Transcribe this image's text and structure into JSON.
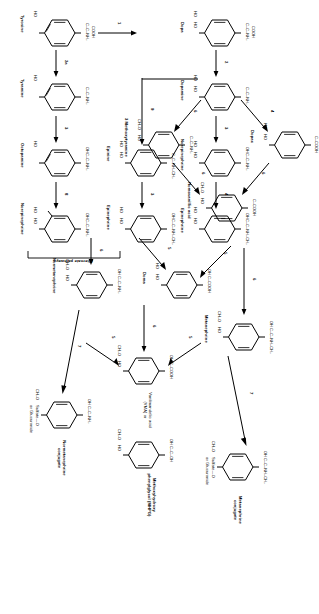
{
  "figure": {
    "orientation": "rotated-90-cw",
    "ink_color": "#000000",
    "background": "#ffffff"
  },
  "compounds": [
    {
      "id": "tyrosine",
      "name": "Tyrosine",
      "chain": "C–C–NH2 / COOH",
      "ring_substituents": [
        "HO"
      ]
    },
    {
      "id": "tyramine",
      "name": "Tyramine",
      "chain": "C–C–NH2",
      "ring_substituents": [
        "HO"
      ]
    },
    {
      "id": "octopamine",
      "name": "Octopamine",
      "chain": "OH C–C–NH2",
      "ring_substituents": [
        "HO"
      ]
    },
    {
      "id": "norepinephrine-alt",
      "name": "Norepinephrine",
      "chain": "OH C–C–NH2",
      "ring_substituents": [
        "HO",
        "HO"
      ]
    },
    {
      "id": "dopa",
      "name": "Dopa",
      "chain": "C–C–NH2 / COOH",
      "ring_substituents": [
        "HO",
        "HO"
      ]
    },
    {
      "id": "dopamine",
      "name": "Dopamine",
      "chain": "C–C–NH2",
      "ring_substituents": [
        "HO",
        "HO"
      ]
    },
    {
      "id": "norepinephrine",
      "name": "Norepinephrine",
      "chain": "OH C–C–NH2",
      "ring_substituents": [
        "HO",
        "HO"
      ]
    },
    {
      "id": "epinephrine",
      "name": "Epinephrine",
      "chain": "OH C–C–NH–CH3",
      "ring_substituents": [
        "HO",
        "HO"
      ]
    },
    {
      "id": "epinine",
      "name": "Epinine",
      "chain": "C–C–NH–CH3",
      "ring_substituents": [
        "HO",
        "HO"
      ]
    },
    {
      "id": "epinephrine-alt",
      "name": "Epinephrine",
      "chain": "OH C–C–NH–CH3",
      "ring_substituents": [
        "HO",
        "HO"
      ]
    },
    {
      "id": "methoxytyramine",
      "name": "3 Methoxytyramine",
      "chain": "C–C–NH2",
      "ring_substituents": [
        "CH3O",
        "HO"
      ]
    },
    {
      "id": "dopac",
      "name": "Dopac",
      "chain": "C–COOH",
      "ring_substituents": [
        "HO",
        "HO"
      ]
    },
    {
      "id": "homovanillic",
      "name": "Homovanillic acid",
      "chain": "C–COOH",
      "ring_substituents": [
        "CH3O",
        "HO"
      ]
    },
    {
      "id": "doma",
      "name": "Doma",
      "chain": "OH C–COOH",
      "ring_substituents": [
        "HO",
        "HO"
      ]
    },
    {
      "id": "normetanephrine",
      "name": "Normetanephrine",
      "chain": "OH C–C–NH2",
      "ring_substituents": [
        "CH3O",
        "HO"
      ]
    },
    {
      "id": "metanephrine",
      "name": "Metanephrine",
      "chain": "OH C–C–NH–CH3",
      "ring_substituents": [
        "CH3O",
        "HO"
      ]
    },
    {
      "id": "vma",
      "name": "Vanilmandelic acid (VMA) or",
      "chain": "OH C–COOH",
      "ring_substituents": [
        "CH3O",
        "HO"
      ]
    },
    {
      "id": "mhpg",
      "name": "Methoxyhydroxy phenylglycol (MHPG)",
      "chain": "OH C–C–OH",
      "ring_substituents": [
        "CH3O",
        "HO"
      ]
    },
    {
      "id": "nm-conjugate",
      "name": "Normetanephrine conjugate",
      "chain": "OH C–C–NH2",
      "ring_substituents": [
        "CH3O",
        "Sulfate—O or Glucuronide"
      ]
    },
    {
      "id": "m-conjugate",
      "name": "Metanephrine conjugate",
      "chain": "OH C–C–NH–CH3",
      "ring_substituents": [
        "CH3O",
        "Sulfate—O or Glucuronide"
      ]
    }
  ],
  "labels": {
    "tyrosine": "Tyrosine",
    "tyramine": "Tyramine",
    "octopamine": "Octopamine",
    "norepinephrine_alt": "Norepinephrine",
    "alternate_pathways": "Alternate pathways",
    "epinephrine_alt": "Epinephrine",
    "dopa": "Dopa",
    "dopamine": "Dopamine",
    "norepinephrine": "Norepinephrine",
    "epinephrine": "Epinephrine",
    "epinine": "Epinine",
    "methoxytyramine": "3 Methoxytyramine",
    "dopac": "Dopac",
    "homovanillic_acid": "Homovanillic acid",
    "doma": "Doma",
    "normetanephrine": "Normetanephrine",
    "metanephrine": "Metanephrine",
    "vma": "Vanilmandelic acid (VMA) or",
    "mhpg": "Methoxyhydroxy phenylglycol (MHPG)",
    "nm_conjugate": "Normetanephrine conjugate",
    "m_conjugate": "Metanephrine conjugate",
    "sulfate_glucuronide": "Sulfate—O or Glucuronide"
  },
  "steps": [
    {
      "id": "s1",
      "number": "1",
      "from": "Tyrosine",
      "to": "Dopa"
    },
    {
      "id": "s2",
      "number": "2",
      "from": "Dopa",
      "to": "Dopamine"
    },
    {
      "id": "s2a",
      "number": "2a",
      "from": "Tyrosine",
      "to": "Tyramine"
    },
    {
      "id": "s3",
      "number": "3",
      "from": "Dopamine",
      "to": "Norepinephrine"
    },
    {
      "id": "s3b",
      "number": "3",
      "from": "Tyramine",
      "to": "Octopamine"
    },
    {
      "id": "s3c",
      "number": "3",
      "from": "Epinine",
      "to": "Epinephrine"
    },
    {
      "id": "s4",
      "number": "4",
      "from": "Norepinephrine",
      "to": "Epinephrine"
    },
    {
      "id": "s4b",
      "number": "4",
      "from": "Dopamine",
      "to": "Dopac"
    },
    {
      "id": "s5",
      "number": "5",
      "from": "Norepinephrine",
      "to": "Doma"
    },
    {
      "id": "s5b",
      "number": "5",
      "from": "Epinephrine",
      "to": "Doma"
    },
    {
      "id": "s5c",
      "number": "5",
      "from": "Normetanephrine",
      "to": "VMA"
    },
    {
      "id": "s5d",
      "number": "5",
      "from": "Metanephrine",
      "to": "VMA"
    },
    {
      "id": "s6",
      "number": "6",
      "from": "Epinephrine",
      "to": "Metanephrine"
    },
    {
      "id": "s6b",
      "number": "6",
      "from": "Norepinephrine",
      "to": "Normetanephrine"
    },
    {
      "id": "s6c",
      "number": "6",
      "from": "Doma",
      "to": "VMA"
    },
    {
      "id": "s6d",
      "number": "6",
      "from": "Dopamine",
      "to": "3 Methoxytyramine"
    },
    {
      "id": "s6e",
      "number": "6",
      "from": "Dopac",
      "to": "Homovanillic acid"
    },
    {
      "id": "s6f",
      "number": "6",
      "from": "3 Methoxytyramine",
      "to": "Homovanillic acid"
    },
    {
      "id": "s7",
      "number": "7",
      "from": "Metanephrine",
      "to": "Metanephrine conjugate"
    },
    {
      "id": "s7b",
      "number": "7",
      "from": "Normetanephrine",
      "to": "Normetanephrine conjugate"
    },
    {
      "id": "s8",
      "number": "8",
      "from": "Octopamine",
      "to": "Norepinephrine"
    },
    {
      "id": "s9",
      "number": "9",
      "from": "Dopamine",
      "to": "Epinine"
    }
  ],
  "step_numbers": {
    "n1": "1",
    "n2": "2",
    "n2a": "2a",
    "n3": "3",
    "n3b": "3",
    "n3c": "3",
    "n4": "4",
    "n4b": "4",
    "n5": "5",
    "n5b": "5",
    "n5c": "5",
    "n5d": "5",
    "n6": "6",
    "n6b": "6",
    "n6c": "6",
    "n6d": "6",
    "n6e": "6",
    "n6f": "6",
    "n7": "7",
    "n7b": "7",
    "n8": "8",
    "n9": "9"
  },
  "chains": {
    "tyrosine": {
      "l1": "C–C–NH₂",
      "l2": "COOH"
    },
    "tyramine": {
      "l1": "C–C–NH₂"
    },
    "octopamine": {
      "l0": "OH",
      "l1": "C–C–NH₂"
    },
    "norepi_alt": {
      "l0": "OH",
      "l1": "C–C–NH₂"
    },
    "dopa": {
      "l1": "C–C–NH₂",
      "l2": "COOH"
    },
    "dopamine": {
      "l1": "C–C–NH₂"
    },
    "norepinephrine": {
      "l0": "OH",
      "l1": "C–C–NH₂"
    },
    "epinephrine": {
      "l0": "OH",
      "l1": "C–C–NH–CH₃"
    },
    "epinine": {
      "l1": "C–C–NH–CH₃"
    },
    "epinephrine_alt": {
      "l0": "OH",
      "l1": "C–C–NH–CH₃"
    },
    "methoxytyramine": {
      "l1": "C–C–NH₂"
    },
    "dopac": {
      "l1": "C–COOH"
    },
    "homovanillic": {
      "l1": "C–COOH"
    },
    "doma": {
      "l0": "OH",
      "l1": "C–COOH"
    },
    "normetanephrine": {
      "l0": "OH",
      "l1": "C–C–NH₂"
    },
    "metanephrine": {
      "l0": "OH",
      "l1": "C–C–NH–CH₃"
    },
    "vma": {
      "l0": "OH",
      "l1": "C–COOH"
    },
    "mhpg": {
      "l0": "OH",
      "l1": "C–C–OH"
    },
    "nmconj": {
      "l0": "OH",
      "l1": "C–C–NH₂"
    },
    "mconj": {
      "l0": "OH",
      "l1": "C–C–NH–CH₃"
    }
  },
  "ring_groups": {
    "ho": "HO",
    "ch3o": "CH₃O",
    "sulfate": "Sulfate—O",
    "or_glucuronide": "or Glucuronide"
  }
}
